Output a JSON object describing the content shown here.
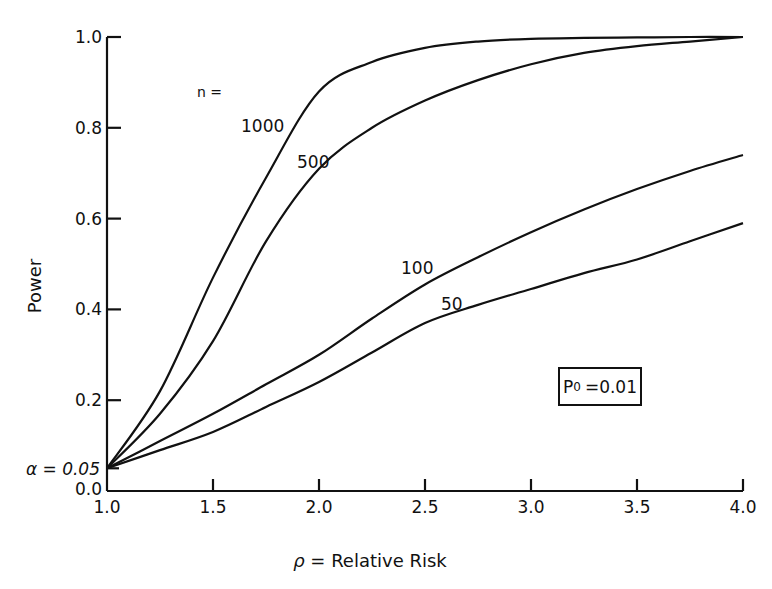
{
  "chart_data": {
    "type": "line",
    "title": "",
    "xlabel": "ρ = Relative Risk",
    "ylabel": "Power",
    "xlim": [
      1.0,
      4.0
    ],
    "ylim": [
      0.0,
      1.0
    ],
    "grid": false,
    "x_ticks": [
      "1.0",
      "1.5",
      "2.0",
      "2.5",
      "3.0",
      "3.5",
      "4.0"
    ],
    "y_ticks": [
      "0.0",
      "0.2",
      "0.4",
      "0.6",
      "0.8",
      "1.0"
    ],
    "x": [
      1.0,
      1.25,
      1.5,
      1.75,
      2.0,
      2.25,
      2.5,
      2.75,
      3.0,
      3.25,
      3.5,
      3.75,
      4.0
    ],
    "series": [
      {
        "name": "n = 1000",
        "label": "1000",
        "values": [
          0.05,
          0.22,
          0.47,
          0.69,
          0.88,
          0.945,
          0.976,
          0.99,
          0.996,
          0.998,
          0.999,
          1.0,
          1.0
        ]
      },
      {
        "name": "n = 500",
        "label": "500",
        "values": [
          0.05,
          0.17,
          0.33,
          0.55,
          0.71,
          0.8,
          0.86,
          0.905,
          0.94,
          0.965,
          0.98,
          0.99,
          1.0
        ]
      },
      {
        "name": "n = 100",
        "label": "100",
        "values": [
          0.05,
          0.11,
          0.17,
          0.235,
          0.3,
          0.38,
          0.455,
          0.515,
          0.57,
          0.62,
          0.665,
          0.705,
          0.74
        ]
      },
      {
        "name": "n = 50",
        "label": "50",
        "values": [
          0.05,
          0.09,
          0.13,
          0.185,
          0.24,
          0.305,
          0.37,
          0.41,
          0.445,
          0.48,
          0.51,
          0.55,
          0.59
        ]
      }
    ],
    "annotations": [
      {
        "text": "n =",
        "x": 1.43,
        "y": 0.88
      },
      {
        "text": "α = 0.05",
        "x": 1.0,
        "y": 0.05
      },
      {
        "text": "P0 = 0.01",
        "x": 3.2,
        "y": 0.2,
        "boxed": true
      }
    ],
    "legend_position": "inline labels"
  },
  "labels": {
    "y_axis": "Power",
    "x_axis_rho": "ρ",
    "x_axis_text": "= Relative Risk",
    "alpha": "α = 0.05",
    "n_eq": "n =",
    "p0_symbol": "P",
    "p0_sub": "0",
    "p0_value": "=0.01",
    "curve_1000": "1000",
    "curve_500": "500",
    "curve_100": "100",
    "curve_50": "50"
  }
}
